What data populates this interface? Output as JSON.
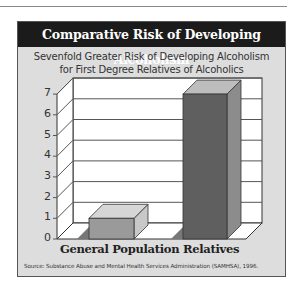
{
  "title": "Comparative Risk of Developing Alcoholism",
  "subtitle_line1": "Sevenfold Greater Risk of Developing Alcoholism",
  "subtitle_line2": "for First Degree Relatives of Alcoholics",
  "source": "Source: Substance Abuse and Mental Health Services Administration (SAMHSA), 1996.",
  "y_ticks": [
    "0",
    "1",
    "2",
    "3",
    "4",
    "5",
    "6",
    "7"
  ],
  "categories": [
    "General Population",
    "Relatives"
  ],
  "colors": {
    "title_bg": "#1b1b1b",
    "panel_bg": "#dddddd",
    "bar_general_front": "#9a9a9a",
    "bar_relatives_front": "#5f5f5f"
  },
  "chart_data": {
    "type": "bar",
    "title": "Comparative Risk of Developing Alcoholism",
    "subtitle": "Sevenfold Greater Risk of Developing Alcoholism for First Degree Relatives of Alcoholics",
    "categories": [
      "General Population",
      "Relatives"
    ],
    "values": [
      1,
      7
    ],
    "xlabel": "",
    "ylabel": "",
    "ylim": [
      0,
      7
    ],
    "yticks": [
      0,
      1,
      2,
      3,
      4,
      5,
      6,
      7
    ],
    "grid": true,
    "style": "3d",
    "legend": null,
    "source": "Source: Substance Abuse and Mental Health Services Administration (SAMHSA), 1996."
  }
}
